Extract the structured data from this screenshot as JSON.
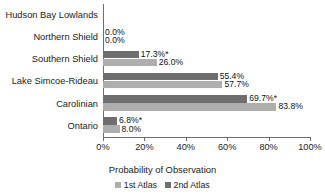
{
  "chart_data": {
    "type": "bar",
    "orientation": "horizontal",
    "title": "",
    "xlabel": "Probability of Observation",
    "ylabel": "",
    "xlim": [
      0,
      100
    ],
    "xticks": [
      0,
      20,
      40,
      60,
      80,
      100
    ],
    "xtick_labels": [
      "0%",
      "20%",
      "40%",
      "60%",
      "80%",
      "100%"
    ],
    "grid": false,
    "legend_position": "bottom",
    "categories": [
      "Hudson Bay Lowlands",
      "Northern Shield",
      "Southern Shield",
      "Lake Simcoe-Rideau",
      "Carolinian",
      "Ontario"
    ],
    "series": [
      {
        "name": "1st Atlas",
        "color": "#aeaeae",
        "values": [
          null,
          0.0,
          26.0,
          57.7,
          83.8,
          8.0
        ],
        "labels": [
          "",
          "0.0%",
          "26.0%",
          "57.7%",
          "83.8%",
          "8.0%"
        ]
      },
      {
        "name": "2nd Atlas",
        "color": "#6e6e6e",
        "values": [
          null,
          0.0,
          17.3,
          55.4,
          69.7,
          6.8
        ],
        "labels": [
          "",
          "0.0%",
          "17.3%*",
          "55.4%",
          "69.7%*",
          "6.8%*"
        ]
      }
    ],
    "annotations": {
      "asterisk_note": "*",
      "asterisk_rows": [
        "Southern Shield",
        "Carolinian",
        "Ontario"
      ]
    }
  }
}
